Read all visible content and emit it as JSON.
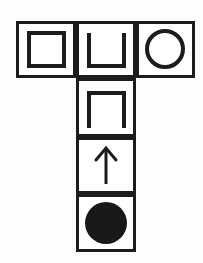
{
  "diagram": {
    "shape_layout": "T-shape",
    "background_color": "#fdfdfd",
    "line_color": "#1c1c1c",
    "glyph_color": "#1c1c1c",
    "fill_color": "#181818",
    "grid": {
      "left": 16,
      "top": 21,
      "cell_width": 60,
      "cell_height": 57,
      "border_width": 3,
      "columns": 3,
      "top_row_count": 3,
      "column_row_count": 4
    },
    "cells": [
      {
        "id": "cell-top-left",
        "label": "square outline",
        "icon": "square-outline-icon",
        "row": 0,
        "col": 0,
        "x": 16,
        "y": 21,
        "w": 60,
        "h": 57
      },
      {
        "id": "cell-top-middle",
        "label": "open-top square",
        "icon": "u-shape-icon",
        "row": 0,
        "col": 1,
        "x": 76,
        "y": 21,
        "w": 60,
        "h": 57
      },
      {
        "id": "cell-top-right",
        "label": "circle outline",
        "icon": "circle-outline-icon",
        "row": 0,
        "col": 2,
        "x": 136,
        "y": 21,
        "w": 59,
        "h": 57
      },
      {
        "id": "cell-stem-1",
        "label": "open-bottom square",
        "icon": "inverted-u-shape-icon",
        "row": 1,
        "col": 1,
        "x": 76,
        "y": 78,
        "w": 60,
        "h": 59
      },
      {
        "id": "cell-stem-2",
        "label": "up arrow",
        "icon": "arrow-up-icon",
        "row": 2,
        "col": 1,
        "x": 76,
        "y": 137,
        "w": 60,
        "h": 57
      },
      {
        "id": "cell-stem-3",
        "label": "filled circle",
        "icon": "filled-circle-icon",
        "row": 3,
        "col": 1,
        "x": 76,
        "y": 194,
        "w": 60,
        "h": 58
      }
    ],
    "glyphs": {
      "square_outline": {
        "name": "square-outline-icon",
        "stroke_width": 4,
        "x": 29,
        "y": 33,
        "w": 35,
        "h": 33
      },
      "u_shape": {
        "name": "u-shape-icon",
        "stroke_width": 4,
        "points": "89,33 89,66 124,66 124,33"
      },
      "circle_outline": {
        "name": "circle-outline-icon",
        "stroke_width": 4,
        "cx": 165,
        "cy": 49,
        "r": 18
      },
      "inverted_u_shape": {
        "name": "inverted-u-shape-icon",
        "stroke_width": 4,
        "points": "89,128 89,93 124,93 124,128"
      },
      "arrow_up": {
        "name": "arrow-up-icon",
        "stroke_width": 3,
        "shaft_x": 106,
        "shaft_top": 149,
        "shaft_bottom": 184,
        "head_left": "96,160",
        "head_apex": "106,148",
        "head_right": "116,160"
      },
      "filled_circle": {
        "name": "filled-circle-icon",
        "cx": 106,
        "cy": 223,
        "r": 21
      }
    }
  }
}
